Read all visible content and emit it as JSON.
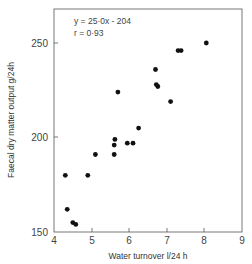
{
  "chart_data": {
    "type": "scatter",
    "title": "",
    "xlabel": "Water turnover  l/24 h",
    "ylabel": "Faecal  dry matter output  g/24h",
    "xlim": [
      4,
      9
    ],
    "ylim": [
      150,
      270
    ],
    "xticks": [
      4,
      5,
      6,
      7,
      8,
      9
    ],
    "yticks": [
      150,
      200,
      250
    ],
    "grid": false,
    "legend": null,
    "annotations": [
      "y = 25·0x - 204",
      "r = 0·93"
    ],
    "regression": {
      "slope": 25.0,
      "intercept": -204,
      "r": 0.93,
      "x_range": [
        4.15,
        7.95
      ]
    },
    "series": [
      {
        "name": "observations",
        "points": [
          {
            "x": 4.3,
            "y": 180
          },
          {
            "x": 4.35,
            "y": 162
          },
          {
            "x": 4.5,
            "y": 155
          },
          {
            "x": 4.58,
            "y": 154
          },
          {
            "x": 4.9,
            "y": 180
          },
          {
            "x": 5.1,
            "y": 191
          },
          {
            "x": 5.6,
            "y": 191
          },
          {
            "x": 5.6,
            "y": 196
          },
          {
            "x": 5.62,
            "y": 199
          },
          {
            "x": 5.7,
            "y": 224
          },
          {
            "x": 5.95,
            "y": 197
          },
          {
            "x": 6.1,
            "y": 197
          },
          {
            "x": 6.25,
            "y": 205
          },
          {
            "x": 6.7,
            "y": 236
          },
          {
            "x": 6.72,
            "y": 228
          },
          {
            "x": 6.76,
            "y": 227
          },
          {
            "x": 7.1,
            "y": 219
          },
          {
            "x": 7.3,
            "y": 246
          },
          {
            "x": 7.38,
            "y": 246
          },
          {
            "x": 8.05,
            "y": 250
          }
        ]
      }
    ]
  },
  "labels": {
    "xlabel": "Water turnover  l/24 h",
    "ylabel": "Faecal  dry matter output  g/24h",
    "equation": "y = 25·0x - 204",
    "r_value": "r = 0·93",
    "xticks": [
      "4",
      "5",
      "6",
      "7",
      "8",
      "9"
    ],
    "yticks": [
      "150",
      "200",
      "250"
    ]
  }
}
